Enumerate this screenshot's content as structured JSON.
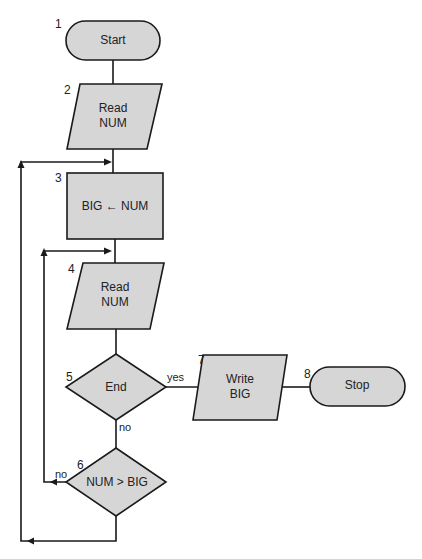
{
  "diagram": {
    "type": "flowchart",
    "nodes": [
      {
        "id": 1,
        "number": "1",
        "shape": "terminal",
        "label_lines": [
          "Start"
        ]
      },
      {
        "id": 2,
        "number": "2",
        "shape": "parallelogram",
        "label_lines": [
          "Read",
          "NUM"
        ]
      },
      {
        "id": 3,
        "number": "3",
        "shape": "rectangle",
        "label_lines": [
          "BIG ← NUM"
        ]
      },
      {
        "id": 4,
        "number": "4",
        "shape": "parallelogram",
        "label_lines": [
          "Read",
          "NUM"
        ]
      },
      {
        "id": 5,
        "number": "5",
        "shape": "diamond",
        "label_lines": [
          "End"
        ]
      },
      {
        "id": 6,
        "number": "6",
        "shape": "diamond",
        "label_lines": [
          "NUM > BIG"
        ]
      },
      {
        "id": 7,
        "number": "7",
        "shape": "parallelogram",
        "label_lines": [
          "Write",
          "BIG"
        ]
      },
      {
        "id": 8,
        "number": "8",
        "shape": "terminal",
        "label_lines": [
          "Stop"
        ]
      }
    ],
    "edges": [
      {
        "from": 1,
        "to": 2,
        "label": ""
      },
      {
        "from": 2,
        "to": 3,
        "label": ""
      },
      {
        "from": 3,
        "to": 4,
        "label": ""
      },
      {
        "from": 4,
        "to": 5,
        "label": ""
      },
      {
        "from": 5,
        "to": 7,
        "label": "yes"
      },
      {
        "from": 5,
        "to": 6,
        "label": "no"
      },
      {
        "from": 6,
        "to": 4,
        "label": "no"
      },
      {
        "from": 6,
        "to": 3,
        "label": ""
      },
      {
        "from": 7,
        "to": 8,
        "label": ""
      }
    ],
    "edge_labels": {
      "end_yes": "yes",
      "end_no": "no",
      "compare_no": "no"
    },
    "colors": {
      "fill": "#d6d6d6",
      "stroke": "#1a1a1a",
      "background": "#ffffff"
    }
  }
}
